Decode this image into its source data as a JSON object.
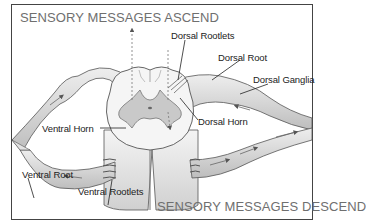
{
  "diagram": {
    "heading_top": "SENSORY MESSAGES ASCEND",
    "heading_bottom": "SENSORY MESSAGES DESCEND",
    "labels": {
      "dorsal_rootlets": "Dorsal Rootlets",
      "dorsal_root": "Dorsal Root",
      "dorsal_ganglia": "Dorsal Ganglia",
      "dorsal_horn": "Dorsal Horn",
      "ventral_horn": "Ventral Horn",
      "ventral_root": "Ventral Root",
      "ventral_rootlets": "Ventral Rootlets"
    },
    "colors": {
      "frame": "#444444",
      "heading": "#6f6f6f",
      "nerve_fill": "#dcdcdc",
      "gray_matter": "#c8c8c8",
      "white_matter": "#f2f2f2"
    }
  }
}
